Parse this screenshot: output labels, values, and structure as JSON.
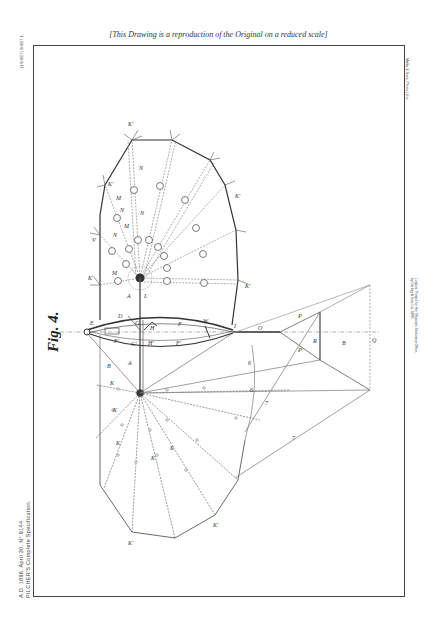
{
  "page": {
    "caption": "[This Drawing is a reproduction of the Original on a reduced scale]",
    "left_margin": {
      "line1": "A.D. 1896. April 30. N° 9144.",
      "line2": "PILCHER'S Complete Specification.",
      "small": "(1 SHEET) SHEET 1."
    },
    "right_margin": {
      "text": "Malby & Sons, Photo-Litho."
    },
    "engraver": {
      "line1": "London. Printed for Her Majesty's Stationery Office,",
      "line2": "by Darling & Son, Ltd. 1896."
    }
  },
  "figure": {
    "title": "Fig. 4.",
    "labels": {
      "upper_sail": [
        "K'",
        "K'",
        "K'",
        "K'",
        "K'",
        "N",
        "N",
        "N",
        "N",
        "M",
        "M",
        "M",
        "L",
        "V",
        "A"
      ],
      "hull": [
        "E",
        "F",
        "F'",
        "F'",
        "G",
        "G'",
        "H",
        "I",
        "H'",
        "D",
        "W"
      ],
      "lower_sail": [
        "B",
        "A",
        "K",
        "K",
        "K",
        "K",
        "K",
        "K'",
        "K'"
      ],
      "tail": [
        "O",
        "P",
        "P'",
        "R",
        "B",
        "Q"
      ],
      "rigging": [
        "6",
        "6",
        "7",
        "7"
      ]
    }
  }
}
